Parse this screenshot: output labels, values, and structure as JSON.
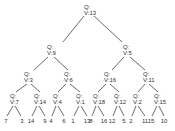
{
  "diagram": {
    "type": "binary-tree",
    "nodes": [
      {
        "id": "n0",
        "q": "Q:",
        "v": "V:13",
        "x": 87,
        "y": 4
      },
      {
        "id": "n1",
        "q": "Q:",
        "v": "V:9",
        "x": 50,
        "y": 44
      },
      {
        "id": "n2",
        "q": "Q:",
        "v": "V:5",
        "x": 126,
        "y": 44
      },
      {
        "id": "n3",
        "q": "Q:",
        "v": "V:3",
        "x": 27,
        "y": 71
      },
      {
        "id": "n4",
        "q": "Q:",
        "v": "V:6",
        "x": 67,
        "y": 71
      },
      {
        "id": "n5",
        "q": "Q:",
        "v": "V:16",
        "x": 107,
        "y": 71
      },
      {
        "id": "n6",
        "q": "Q:",
        "v": "V:11",
        "x": 146,
        "y": 71
      },
      {
        "id": "n7",
        "q": "Q:",
        "v": "V:7",
        "x": 13,
        "y": 93
      },
      {
        "id": "n8",
        "q": "Q:",
        "v": "V:14",
        "x": 37,
        "y": 93
      },
      {
        "id": "n9",
        "q": "Q:",
        "v": "V:4",
        "x": 56,
        "y": 93
      },
      {
        "id": "n10",
        "q": "Q:",
        "v": "V:1",
        "x": 79,
        "y": 93
      },
      {
        "id": "n11",
        "q": "Q:",
        "v": "V:18",
        "x": 96,
        "y": 93
      },
      {
        "id": "n12",
        "q": "Q:",
        "v": "V:12",
        "x": 117,
        "y": 93
      },
      {
        "id": "n13",
        "q": "Q:",
        "v": "V:2",
        "x": 136,
        "y": 93
      },
      {
        "id": "n14",
        "q": "Q:",
        "v": "V:15",
        "x": 157,
        "y": 93
      }
    ],
    "leaves": [
      {
        "label": "7",
        "x": 6
      },
      {
        "label": "3",
        "x": 22
      },
      {
        "label": "14",
        "x": 31
      },
      {
        "label": "9",
        "x": 45
      },
      {
        "label": "4",
        "x": 51
      },
      {
        "label": "6",
        "x": 64
      },
      {
        "label": "1",
        "x": 73
      },
      {
        "label": "13",
        "x": 87
      },
      {
        "label": "8",
        "x": 91
      },
      {
        "label": "16",
        "x": 104
      },
      {
        "label": "12",
        "x": 112
      },
      {
        "label": "5",
        "x": 124
      },
      {
        "label": "2",
        "x": 131
      },
      {
        "label": "11",
        "x": 145
      },
      {
        "label": "15",
        "x": 151
      },
      {
        "label": "10",
        "x": 164
      }
    ],
    "line_color": "#444444"
  }
}
